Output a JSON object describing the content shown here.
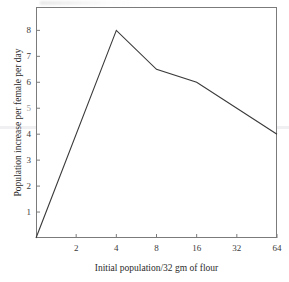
{
  "chart_data": {
    "type": "line",
    "title": "",
    "xlabel": "Initial population/32 gm of flour",
    "ylabel": "Population increase per female per day",
    "xscale": "log2",
    "xlim": [
      1,
      64
    ],
    "ylim": [
      0,
      8.9
    ],
    "grid": false,
    "legend": null,
    "xticks": [
      2,
      4,
      8,
      16,
      32,
      64
    ],
    "xtick_labels": [
      "2",
      "4",
      "8",
      "16",
      "32",
      "64"
    ],
    "yticks": [
      1,
      2,
      3,
      4,
      5,
      6,
      7,
      8
    ],
    "ytick_labels": [
      "1",
      "2",
      "3",
      "4",
      "5",
      "6",
      "7",
      "8"
    ],
    "series": [
      {
        "name": "Population increase per female per day",
        "x": [
          1,
          4,
          8,
          16,
          32,
          64
        ],
        "values": [
          0.0,
          8.0,
          6.5,
          6.0,
          5.0,
          4.0
        ],
        "color": "#3a3a3a"
      }
    ]
  },
  "axes": {
    "frame_color": "#7b7b7b"
  }
}
